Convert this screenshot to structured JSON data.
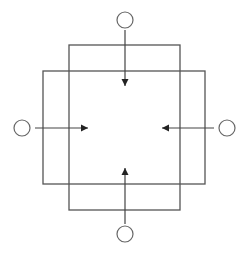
{
  "diagram": {
    "colors": {
      "background": "#ffffff",
      "line": "#555555",
      "arrowhead": "#222222",
      "node_stroke": "#666666"
    },
    "rectangles": [
      {
        "id": "tall-rect",
        "x": 69,
        "y": 45,
        "width": 111,
        "height": 165
      },
      {
        "id": "wide-rect",
        "x": 43,
        "y": 71,
        "width": 162,
        "height": 113
      }
    ],
    "nodes": [
      {
        "id": "top-node",
        "cx": 125,
        "cy": 20,
        "r": 8,
        "label": ""
      },
      {
        "id": "left-node",
        "cx": 22,
        "cy": 128,
        "r": 8,
        "label": ""
      },
      {
        "id": "right-node",
        "cx": 227,
        "cy": 128,
        "r": 8,
        "label": ""
      },
      {
        "id": "bottom-node",
        "cx": 125,
        "cy": 234,
        "r": 8,
        "label": ""
      }
    ],
    "arrows": [
      {
        "id": "top-arrow",
        "from": "top-node",
        "direction": "down",
        "x1": 125,
        "y1": 30,
        "x2": 125,
        "y2": 86
      },
      {
        "id": "left-arrow",
        "from": "left-node",
        "direction": "right",
        "x1": 35,
        "y1": 128,
        "x2": 88,
        "y2": 128
      },
      {
        "id": "right-arrow",
        "from": "right-node",
        "direction": "left",
        "x1": 214,
        "y1": 128,
        "x2": 162,
        "y2": 128
      },
      {
        "id": "bottom-arrow",
        "from": "bottom-node",
        "direction": "up",
        "x1": 125,
        "y1": 224,
        "x2": 125,
        "y2": 168
      }
    ]
  }
}
